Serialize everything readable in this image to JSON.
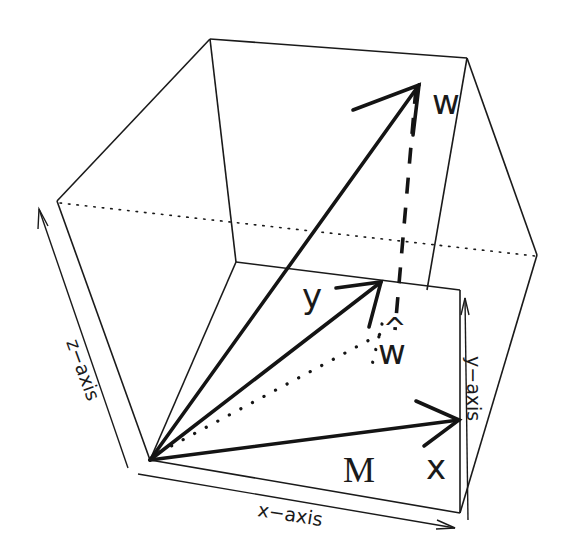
{
  "diagram": {
    "type": "3d-vector-projection",
    "axes": {
      "x": "x−axis",
      "y": "y−axis",
      "z": "z−axis"
    },
    "vectors": {
      "w": "w",
      "y": "y",
      "x": "x",
      "w_hat_hat": "^",
      "w_hat_base": "w"
    },
    "plane_label": "M"
  }
}
